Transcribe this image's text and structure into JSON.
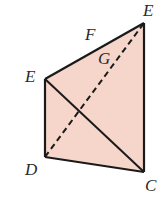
{
  "diagram": {
    "fill_color": "#f6d6ca",
    "stroke_color": "#1a1a1a",
    "vertices": {
      "E_top": {
        "x": 144,
        "y": 23
      },
      "E_left": {
        "x": 45,
        "y": 79
      },
      "D": {
        "x": 45,
        "y": 157
      },
      "C": {
        "x": 144,
        "y": 172
      }
    },
    "labels": [
      {
        "text": "E",
        "x": 143,
        "y": 16
      },
      {
        "text": "F",
        "x": 85,
        "y": 40
      },
      {
        "text": "G",
        "x": 98,
        "y": 64
      },
      {
        "text": "E",
        "x": 25,
        "y": 82
      },
      {
        "text": "D",
        "x": 25,
        "y": 175
      },
      {
        "text": "C",
        "x": 145,
        "y": 191
      }
    ],
    "solid_segments": [
      [
        "E_left",
        "E_top"
      ],
      [
        "E_top",
        "C"
      ],
      [
        "C",
        "D"
      ],
      [
        "D",
        "E_left"
      ],
      [
        "E_left",
        "C"
      ]
    ],
    "dashed_segments": [
      [
        "D",
        "E_top"
      ]
    ]
  }
}
